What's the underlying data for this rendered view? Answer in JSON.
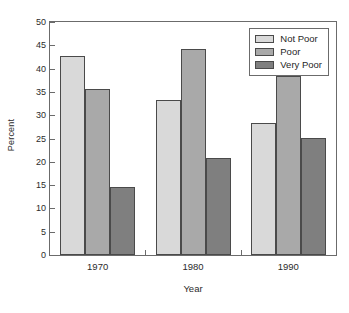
{
  "chart_data": {
    "type": "bar",
    "title": "",
    "xlabel": "Year",
    "ylabel": "Percent",
    "categories": [
      "1970",
      "1980",
      "1990"
    ],
    "series": [
      {
        "name": "Not Poor",
        "color": "#d9d9d9",
        "values": [
          42.7,
          33.3,
          28.3
        ]
      },
      {
        "name": "Poor",
        "color": "#a9a9a9",
        "values": [
          35.6,
          44.3,
          38.4
        ]
      },
      {
        "name": "Very Poor",
        "color": "#7f7f7f",
        "values": [
          14.5,
          20.8,
          25.2
        ]
      }
    ],
    "ylim": [
      0,
      50
    ],
    "yticks": [
      0,
      5,
      10,
      15,
      20,
      25,
      30,
      35,
      40,
      45,
      50
    ],
    "ytick_labels": [
      "0",
      "5",
      "10",
      "15",
      "20",
      "25",
      "30",
      "35",
      "40",
      "45",
      "50"
    ],
    "grid": false,
    "legend_position": "top-right",
    "frame": true
  },
  "legend": {
    "entries": [
      {
        "label": "Not Poor",
        "color": "#d9d9d9"
      },
      {
        "label": "Poor",
        "color": "#a9a9a9"
      },
      {
        "label": "Very Poor",
        "color": "#7f7f7f"
      }
    ]
  },
  "axes": {
    "y_title": "Percent",
    "x_title": "Year"
  }
}
